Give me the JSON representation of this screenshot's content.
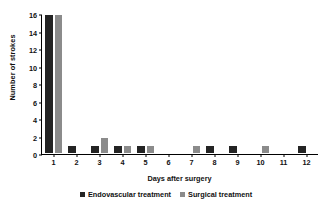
{
  "chart_data": {
    "type": "bar",
    "title": "",
    "xlabel": "Days after surgery",
    "ylabel": "Number of strokes",
    "categories": [
      "1",
      "2",
      "3",
      "4",
      "5",
      "6",
      "7",
      "8",
      "9",
      "10",
      "11",
      "12"
    ],
    "series": [
      {
        "name": "Endovascular treatment",
        "color": "#242424",
        "values": [
          16,
          1,
          1,
          1,
          1,
          0,
          0,
          1,
          1,
          0,
          0,
          1
        ]
      },
      {
        "name": "Surgical treatment",
        "color": "#8b8b8b",
        "values": [
          16,
          0,
          2,
          1,
          1,
          0,
          1,
          0,
          0,
          1,
          0,
          0
        ]
      }
    ],
    "ylim": [
      0,
      16
    ],
    "yticks": [
      "0",
      "2",
      "4",
      "6",
      "8",
      "10",
      "12",
      "14",
      "16"
    ],
    "grid": false,
    "legend_position": "bottom-center"
  }
}
